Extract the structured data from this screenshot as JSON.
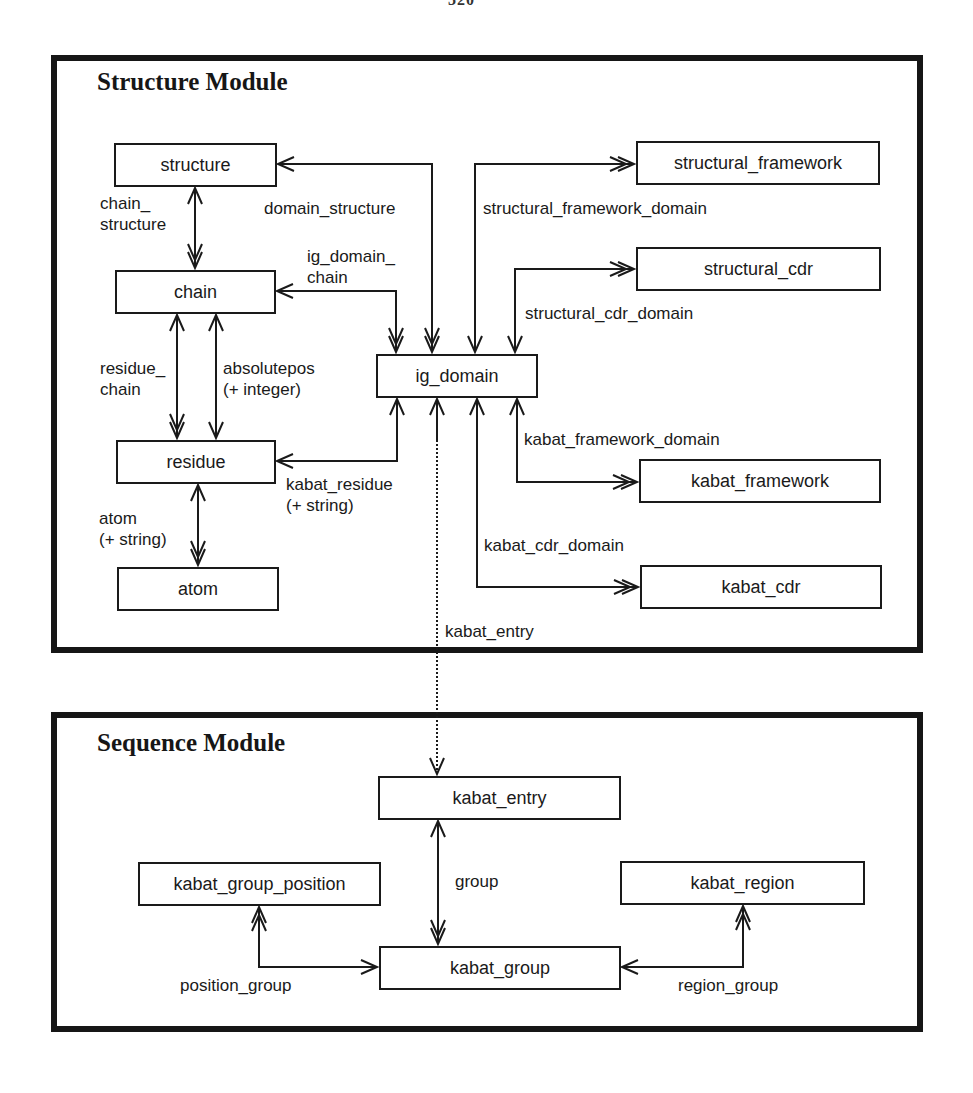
{
  "page": {
    "number": "320"
  },
  "structure_module": {
    "title": "Structure Module",
    "entities": {
      "structure": "structure",
      "chain": "chain",
      "residue": "residue",
      "atom": "atom",
      "ig_domain": "ig_domain",
      "structural_framework": "structural_framework",
      "structural_cdr": "structural_cdr",
      "kabat_framework": "kabat_framework",
      "kabat_cdr": "kabat_cdr"
    },
    "relationships": {
      "chain_structure_1": "chain_",
      "chain_structure_2": "structure",
      "domain_structure": "domain_structure",
      "ig_domain_chain_1": "ig_domain_",
      "ig_domain_chain_2": "chain",
      "structural_framework_domain": "structural_framework_domain",
      "structural_cdr_domain": "structural_cdr_domain",
      "residue_chain_1": "residue_",
      "residue_chain_2": "chain",
      "absolutepos_1": "absolutepos",
      "absolutepos_2": "(+ integer)",
      "kabat_residue_1": "kabat_residue",
      "kabat_residue_2": "(+ string)",
      "atom_rel_1": "atom",
      "atom_rel_2": "(+ string)",
      "kabat_framework_domain": "kabat_framework_domain",
      "kabat_cdr_domain": "kabat_cdr_domain",
      "kabat_entry": "kabat_entry"
    }
  },
  "sequence_module": {
    "title": "Sequence Module",
    "entities": {
      "kabat_entry": "kabat_entry",
      "kabat_group_position": "kabat_group_position",
      "kabat_group": "kabat_group",
      "kabat_region": "kabat_region"
    },
    "relationships": {
      "group": "group",
      "position_group": "position_group",
      "region_group": "region_group"
    }
  },
  "colors": {
    "ink": "#1a1a1a",
    "background": "#ffffff"
  }
}
